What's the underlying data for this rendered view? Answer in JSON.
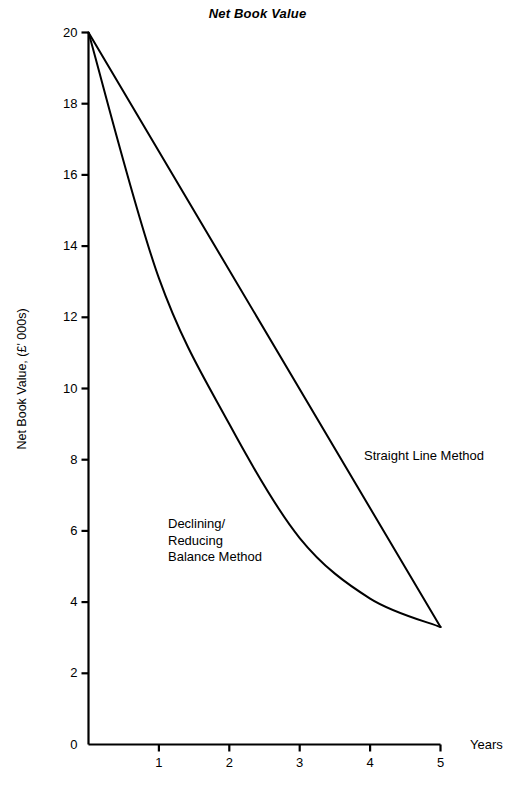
{
  "chart_data": {
    "type": "line",
    "title": "Net Book Value",
    "xlabel": "Years",
    "ylabel": "Net Book Value, (£' 000s)",
    "xlim": [
      0,
      5
    ],
    "ylim": [
      0,
      20
    ],
    "grid": false,
    "legend_position": "inline-annotations",
    "x": [
      0,
      1,
      2,
      3,
      4,
      5
    ],
    "x_tick_labels": [
      "1",
      "2",
      "3",
      "4",
      "5"
    ],
    "x_ticks": [
      1,
      2,
      3,
      4,
      5
    ],
    "y_ticks": [
      0,
      2,
      4,
      6,
      8,
      10,
      12,
      14,
      16,
      18,
      20
    ],
    "y_tick_labels": [
      "0",
      "2",
      "4",
      "6",
      "8",
      "10",
      "12",
      "14",
      "16",
      "18",
      "20"
    ],
    "series": [
      {
        "name": "Straight Line Method",
        "annotation": "Straight Line Method",
        "values": [
          20,
          16.65,
          13.3,
          9.95,
          6.65,
          3.3
        ]
      },
      {
        "name": "Declining/Reducing Balance Method",
        "annotation": "Declining/\nReducing\nBalance Method",
        "values": [
          20,
          13.1,
          9.0,
          5.8,
          4.1,
          3.3
        ]
      }
    ],
    "line_color": "#000000",
    "axis_color": "#000000",
    "background_color": "#ffffff"
  }
}
